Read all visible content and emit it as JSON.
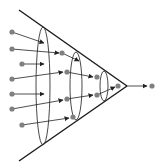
{
  "diagram": {
    "type": "funnel-convergence",
    "colors": {
      "line": "#1a1a1a",
      "ellipse": "#333333",
      "arrow": "#222222",
      "dot": "#808080"
    },
    "funnel": {
      "top_start": [
        19,
        10
      ],
      "bottom_start": [
        19,
        161
      ],
      "apex": [
        127,
        86
      ]
    },
    "ellipses": [
      {
        "cx": 43,
        "cy": 86,
        "rx": 7,
        "ry": 59
      },
      {
        "cx": 76,
        "cy": 86,
        "rx": 6,
        "ry": 34
      },
      {
        "cx": 104,
        "cy": 86,
        "rx": 4,
        "ry": 15
      }
    ],
    "dots": [
      [
        12,
        32
      ],
      [
        12,
        49
      ],
      [
        22,
        64
      ],
      [
        12,
        79
      ],
      [
        12,
        94
      ],
      [
        12,
        109
      ],
      [
        22,
        125
      ],
      [
        62,
        53
      ],
      [
        67,
        72
      ],
      [
        67,
        99
      ],
      [
        73,
        117
      ],
      [
        97,
        77
      ],
      [
        97,
        95
      ],
      [
        118,
        86
      ],
      [
        152,
        86
      ]
    ],
    "arrows": [
      [
        [
          12,
          32
        ],
        [
          44,
          43
        ]
      ],
      [
        [
          12,
          49
        ],
        [
          59,
          53
        ]
      ],
      [
        [
          22,
          64
        ],
        [
          44,
          64
        ]
      ],
      [
        [
          12,
          79
        ],
        [
          63,
          72
        ]
      ],
      [
        [
          12,
          94
        ],
        [
          44,
          94
        ]
      ],
      [
        [
          12,
          109
        ],
        [
          63,
          100
        ]
      ],
      [
        [
          22,
          125
        ],
        [
          69,
          118
        ]
      ],
      [
        [
          62,
          53
        ],
        [
          79,
          61
        ]
      ],
      [
        [
          67,
          72
        ],
        [
          93,
          77
        ]
      ],
      [
        [
          67,
          99
        ],
        [
          93,
          95
        ]
      ],
      [
        [
          97,
          95
        ],
        [
          115,
          87
        ]
      ],
      [
        [
          127,
          86
        ],
        [
          147,
          86
        ]
      ]
    ]
  }
}
